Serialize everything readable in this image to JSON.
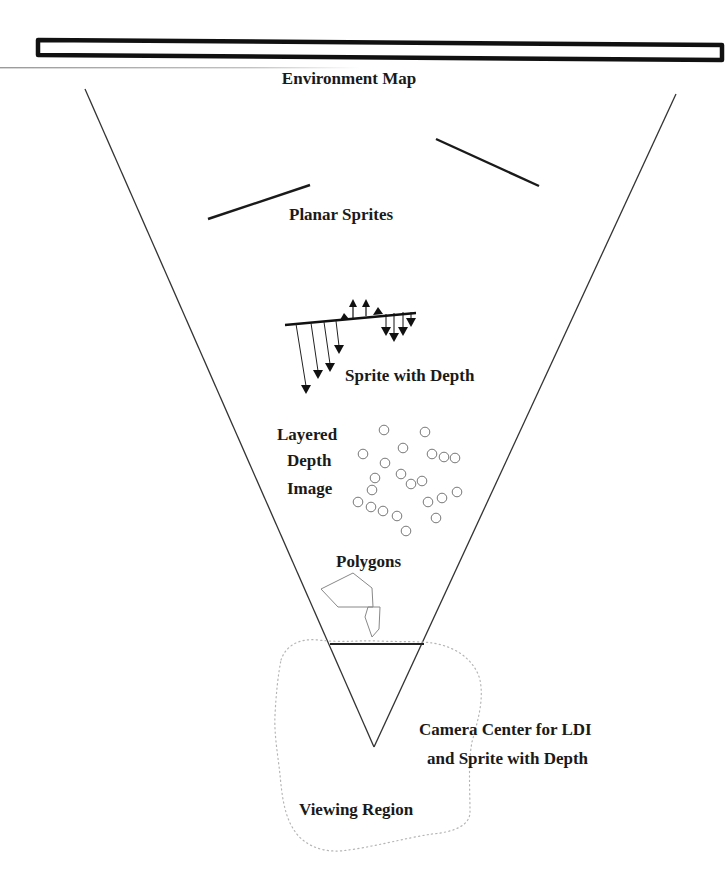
{
  "diagram": {
    "labels": {
      "environment_map": "Environment Map",
      "planar_sprites": "Planar Sprites",
      "sprite_with_depth": "Sprite with Depth",
      "ldi_line1": "Layered",
      "ldi_line2": "Depth",
      "ldi_line3": "Image",
      "polygons": "Polygons",
      "camera_line1": "Camera Center for LDI",
      "camera_line2": "and Sprite with Depth",
      "viewing_region": "Viewing Region"
    },
    "colors": {
      "stroke": "#1a1a1a",
      "light_stroke": "#8a8a8a",
      "dotted": "#b0b0b0",
      "background": "#ffffff"
    }
  }
}
